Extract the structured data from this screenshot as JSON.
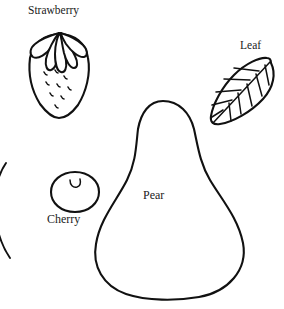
{
  "figure": {
    "background_color": "#ffffff",
    "line_color": "#111111",
    "width": 284,
    "height": 309
  },
  "labels": {
    "strawberry": "Strawberry",
    "leaf": "Leaf",
    "cherry": "Cherry",
    "pear": "Pear"
  },
  "shapes": [
    {
      "name": "strawberry",
      "label": "Strawberry",
      "description": "Heart shaped berry outline with five pointed sepals at the crown and scattered comma shaped seed marks on the body",
      "seed_count": 9,
      "sepal_count": 5
    },
    {
      "name": "leaf",
      "label": "Leaf",
      "description": "Tilted pointed oval leaf with a diagonal midrib and parallel side veins on both halves",
      "vein_count": 10
    },
    {
      "name": "cherry",
      "label": "Cherry",
      "description": "Small rounded berry outline with a crescent stem dimple at the top"
    },
    {
      "name": "pear",
      "label": "Pear",
      "description": "Large teardrop pear outline, narrow rounded top widening to a broad rounded base"
    },
    {
      "name": "partial-shape-left-edge",
      "label": "",
      "description": "Partially visible curved outline cropped by the left image border"
    }
  ]
}
